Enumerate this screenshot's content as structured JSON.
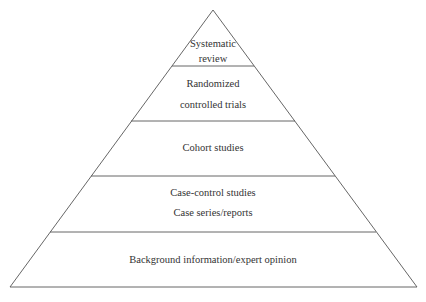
{
  "diagram": {
    "type": "pyramid",
    "levels": [
      {
        "lines": [
          "Systematic",
          "review"
        ]
      },
      {
        "lines": [
          "Randomized",
          "controlled trials"
        ]
      },
      {
        "lines": [
          "Cohort studies"
        ]
      },
      {
        "lines": [
          "Case-control studies",
          "Case series/reports"
        ]
      },
      {
        "lines": [
          "Background information/expert opinion"
        ]
      }
    ]
  }
}
